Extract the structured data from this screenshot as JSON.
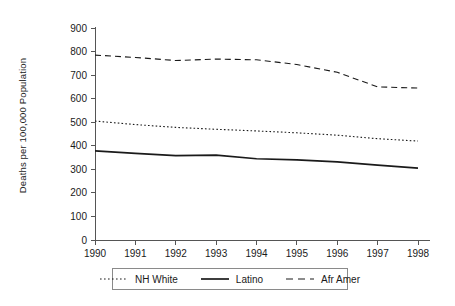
{
  "chart_data": {
    "type": "line",
    "title": "",
    "xlabel": "",
    "ylabel": "Deaths per 100,000 Population",
    "x": [
      1990,
      1991,
      1992,
      1993,
      1994,
      1995,
      1996,
      1997,
      1998
    ],
    "xtick_labels": [
      "1990",
      "1991",
      "1992",
      "1993",
      "1994",
      "1995",
      "1996",
      "1997",
      "1998"
    ],
    "ytick_labels": [
      "0",
      "100",
      "200",
      "300",
      "400",
      "500",
      "600",
      "700",
      "800",
      "900"
    ],
    "yticks": [
      0,
      100,
      200,
      300,
      400,
      500,
      600,
      700,
      800,
      900
    ],
    "ylim": [
      0,
      900
    ],
    "xlim": [
      1990,
      1998
    ],
    "grid": false,
    "legend_position": "bottom",
    "series": [
      {
        "name": "NH White",
        "style": "dotted",
        "color": "#1a1a1a",
        "values": [
          505,
          490,
          478,
          470,
          463,
          455,
          445,
          430,
          420
        ]
      },
      {
        "name": "Latino",
        "style": "solid",
        "color": "#1a1a1a",
        "values": [
          378,
          368,
          358,
          360,
          345,
          340,
          332,
          318,
          305
        ]
      },
      {
        "name": "Afr Amer",
        "style": "dashed",
        "color": "#1a1a1a",
        "values": [
          785,
          775,
          762,
          768,
          765,
          745,
          712,
          650,
          645
        ]
      }
    ]
  },
  "legend": {
    "items": [
      {
        "label": "NH White",
        "style": "dotted"
      },
      {
        "label": "Latino",
        "style": "solid"
      },
      {
        "label": "Afr Amer",
        "style": "dashed"
      }
    ]
  }
}
